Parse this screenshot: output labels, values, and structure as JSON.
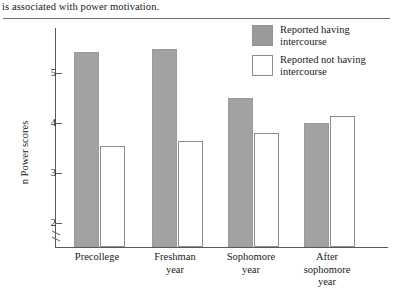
{
  "caption": {
    "text": "is associated with power motivation."
  },
  "chart_data": {
    "type": "bar",
    "title": "",
    "xlabel": "",
    "ylabel": "n Power scores",
    "ylim": [
      2,
      5.6
    ],
    "yticks": [
      2,
      3,
      4,
      5
    ],
    "ytick_labels": [
      "2",
      "3",
      "4",
      "5"
    ],
    "y_axis_break": true,
    "grid": false,
    "legend_position": "top-right",
    "categories": [
      "Precollege",
      "Freshman year",
      "Sophomore year",
      "After sophomore year"
    ],
    "series": [
      {
        "name": "Reported having intercourse",
        "color": "#a2a2a2",
        "style": "filled",
        "values": [
          5.42,
          5.48,
          4.5,
          4.0
        ]
      },
      {
        "name": "Reported not having intercourse",
        "color": "#ffffff",
        "style": "hollow",
        "values": [
          3.55,
          3.65,
          3.8,
          4.15
        ]
      }
    ]
  },
  "legend": {
    "items": [
      {
        "label": "Reported having intercourse",
        "style": "filled"
      },
      {
        "label": "Reported not having intercourse",
        "style": "hollow"
      }
    ]
  },
  "axis": {
    "y_title": "n Power scores",
    "tick_2": "2",
    "tick_3": "3",
    "tick_4": "4",
    "tick_5": "5"
  },
  "categories_display": [
    "Precollege",
    "Freshman\nyear",
    "Sophomore\nyear",
    "After\nsophomore\nyear"
  ]
}
